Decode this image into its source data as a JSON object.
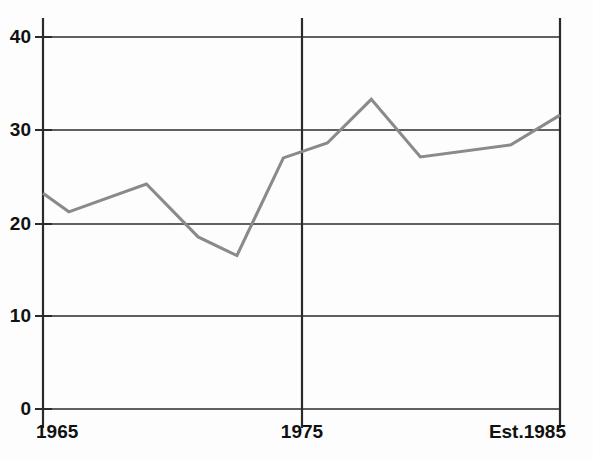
{
  "chart_data": {
    "type": "line",
    "title": "",
    "subtitle": "",
    "xlabel": "",
    "ylabel": "",
    "xlim": [
      1965,
      1985
    ],
    "ylim": [
      0,
      40
    ],
    "grid": true,
    "legend": false,
    "legend_position": "none",
    "line_color": "#8a8a8a",
    "axis_color": "#2b2b2b",
    "background_color": "#fdfdfd",
    "y_ticks": [
      {
        "value": 40,
        "label": "40"
      },
      {
        "value": 30,
        "label": "30"
      },
      {
        "value": 20,
        "label": "20"
      },
      {
        "value": 10,
        "label": "10"
      },
      {
        "value": 0,
        "label": "0"
      }
    ],
    "x_ticks": [
      {
        "value": 1965,
        "label": "1965"
      },
      {
        "value": 1975,
        "label": "1975"
      },
      {
        "value": 1985,
        "label": "Est.1985"
      }
    ],
    "x": [
      1965,
      1966,
      1969,
      1971,
      1972.5,
      1974.3,
      1976,
      1977.7,
      1979.6,
      1983.1,
      1985
    ],
    "values": [
      23.2,
      21.2,
      24.2,
      18.5,
      16.5,
      27.0,
      28.6,
      33.3,
      27.1,
      28.4,
      31.6
    ],
    "series": [
      {
        "name": "series-1",
        "color": "#8a8a8a",
        "points": [
          {
            "x": 1965,
            "y": 23.2
          },
          {
            "x": 1966,
            "y": 21.2
          },
          {
            "x": 1969,
            "y": 24.2
          },
          {
            "x": 1971,
            "y": 18.5
          },
          {
            "x": 1972.5,
            "y": 16.5
          },
          {
            "x": 1974.3,
            "y": 27.0
          },
          {
            "x": 1976,
            "y": 28.6
          },
          {
            "x": 1977.7,
            "y": 33.3
          },
          {
            "x": 1979.6,
            "y": 27.1
          },
          {
            "x": 1983.1,
            "y": 28.4
          },
          {
            "x": 1985,
            "y": 31.6
          }
        ]
      }
    ],
    "annotations": []
  }
}
